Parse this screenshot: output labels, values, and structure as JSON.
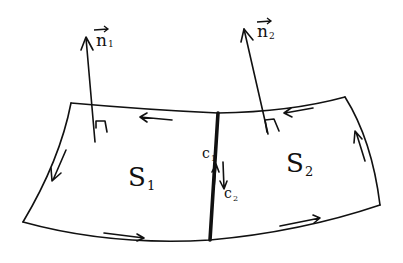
{
  "diagram": {
    "type": "surface-normals-orientation",
    "surfaces": [
      {
        "label": "S",
        "subscript": "1"
      },
      {
        "label": "S",
        "subscript": "2"
      }
    ],
    "normals": [
      {
        "label": "n",
        "subscript": "1",
        "vector_arrow": "→"
      },
      {
        "label": "n",
        "subscript": "2",
        "vector_arrow": "→"
      }
    ],
    "curves": [
      {
        "label": "c",
        "subscript": "1",
        "direction": "up"
      },
      {
        "label": "c",
        "subscript": "2",
        "direction": "down"
      }
    ],
    "colors": {
      "ink": "#111111",
      "background": "#ffffff"
    }
  }
}
